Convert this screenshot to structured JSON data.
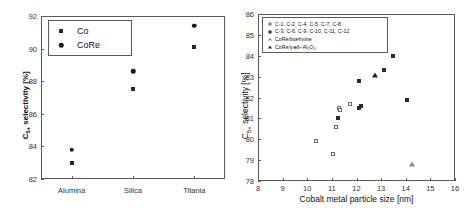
{
  "chart_data": [
    {
      "panel": "left",
      "type": "scatter",
      "title": "",
      "xlabel": "",
      "ylabel": "C5+ selectivity [%]",
      "ylabel_main": "C",
      "ylabel_sub": "5+",
      "ylabel_tail": " selectivity [%]",
      "categories": [
        "Alumina",
        "Silica",
        "Titania"
      ],
      "ylim": [
        82,
        92
      ],
      "yticks": [
        82,
        84,
        86,
        88,
        90,
        92
      ],
      "grid": false,
      "legend_position": "top-left",
      "series": [
        {
          "name": "Co",
          "marker": "square-filled",
          "values": [
            83.0,
            87.5,
            90.1
          ]
        },
        {
          "name": "CoRe",
          "marker": "circle-filled",
          "values": [
            83.8,
            88.6,
            91.4
          ]
        }
      ]
    },
    {
      "panel": "right",
      "type": "scatter",
      "title": "",
      "xlabel": "Cobalt metal particle size [nm]",
      "ylabel": "C5+ selectivity [%]",
      "ylabel_main": "C",
      "ylabel_sub": "5+",
      "ylabel_tail": " selectivity [%]",
      "xlim": [
        8,
        16
      ],
      "xticks": [
        8,
        9,
        10,
        11,
        12,
        13,
        14,
        15,
        16
      ],
      "ylim": [
        78,
        86
      ],
      "yticks": [
        78,
        79,
        80,
        81,
        82,
        83,
        84,
        85,
        86
      ],
      "grid": false,
      "legend_position": "top-left",
      "series": [
        {
          "name": "C-1, C-2, C-4, C-5, C-7, C-8",
          "marker": "square-open",
          "points": [
            [
              10.35,
              79.9
            ],
            [
              11.05,
              79.3
            ],
            [
              11.15,
              80.6
            ],
            [
              11.3,
              81.5
            ],
            [
              11.35,
              81.4
            ],
            [
              11.75,
              81.7
            ]
          ]
        },
        {
          "name": "C-3, C-6, C-9, C-10, C-11, C-12",
          "marker": "square-filled",
          "points": [
            [
              11.25,
              81.0
            ],
            [
              12.1,
              81.5
            ],
            [
              12.2,
              81.6
            ],
            [
              12.1,
              82.8
            ],
            [
              13.1,
              83.3
            ],
            [
              13.5,
              84.0
            ],
            [
              14.05,
              81.9
            ]
          ]
        },
        {
          "name": "CoRe/boehmite",
          "marker": "triangle-open",
          "points": [
            [
              14.25,
              78.8
            ]
          ]
        },
        {
          "name": "CoRe/γ⊕δ–Al2O3",
          "marker": "triangle-filled",
          "points": [
            [
              12.75,
              83.1
            ]
          ]
        }
      ]
    }
  ],
  "left": {
    "ylabel_main": "C",
    "ylabel_sub": "5+",
    "ylabel_tail": " selectivity [%]",
    "yticks": [
      "92",
      "90",
      "88",
      "86",
      "84",
      "82"
    ],
    "xticks": [
      "Alumina",
      "Silica",
      "Titania"
    ],
    "legend": [
      {
        "label": "Co",
        "marker": "square-filled"
      },
      {
        "label": "CoRe",
        "marker": "circle-filled"
      }
    ]
  },
  "right": {
    "ylabel_main": "C",
    "ylabel_sub": "5+",
    "ylabel_tail": " selectivity [%]",
    "xlabel": "Cobalt metal particle size [nm]",
    "yticks": [
      "86",
      "85",
      "84",
      "83",
      "82",
      "81",
      "80",
      "79",
      "78"
    ],
    "xticks": [
      "8",
      "9",
      "10",
      "11",
      "12",
      "13",
      "14",
      "15",
      "16"
    ],
    "legend": [
      {
        "label": "C‑1, C‑2, C‑4, C‑5, C‑7, C‑8",
        "marker": "square-open"
      },
      {
        "label": "C‑3, C‑6, C‑9, C‑10, C‑11, C‑12",
        "marker": "square-filled"
      },
      {
        "label": "CoRe/boehmite",
        "marker": "triangle-open"
      },
      {
        "label": "CoRe/γ⊕δ–Al₂O₃",
        "marker": "triangle-filled"
      }
    ]
  }
}
